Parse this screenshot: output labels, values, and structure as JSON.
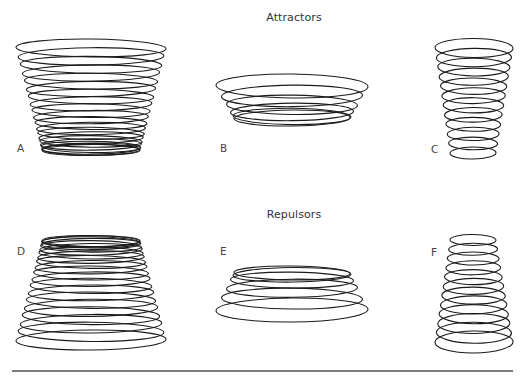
{
  "diagram": {
    "sections": [
      {
        "id": "attractors",
        "title": "Attractors",
        "title_x": 294,
        "title_y": 11
      },
      {
        "id": "repulsors",
        "title": "Repulsors",
        "title_x": 294,
        "title_y": 208
      }
    ],
    "stroke_color": "#1a1a1a",
    "rule_color": "#7d7d7d",
    "panels": [
      {
        "label": "A",
        "section": "attractors",
        "label_x": 17,
        "label_y": 142,
        "rings": 20,
        "top": {
          "cx": 91,
          "cy": 48,
          "rx": 75,
          "ry": 9
        },
        "bottom": {
          "cx": 91,
          "cy": 150,
          "rx": 49,
          "ry": 5.5
        },
        "spacing": "converging"
      },
      {
        "label": "B",
        "section": "attractors",
        "label_x": 220,
        "label_y": 142,
        "rings": 6,
        "top": {
          "cx": 292,
          "cy": 86,
          "rx": 76,
          "ry": 12
        },
        "bottom": {
          "cx": 292,
          "cy": 118,
          "rx": 58,
          "ry": 8
        },
        "spacing": "converging"
      },
      {
        "label": "C",
        "section": "attractors",
        "label_x": 431,
        "label_y": 143,
        "rings": 12,
        "top": {
          "cx": 474,
          "cy": 48,
          "rx": 39,
          "ry": 9.5
        },
        "bottom": {
          "cx": 473,
          "cy": 153,
          "rx": 23,
          "ry": 6
        },
        "spacing": "uniform"
      },
      {
        "label": "D",
        "section": "repulsors",
        "label_x": 17,
        "label_y": 245,
        "rings": 20,
        "top": {
          "cx": 91,
          "cy": 241,
          "rx": 49,
          "ry": 5.5
        },
        "bottom": {
          "cx": 91,
          "cy": 340,
          "rx": 75,
          "ry": 10
        },
        "spacing": "diverging"
      },
      {
        "label": "E",
        "section": "repulsors",
        "label_x": 220,
        "label_y": 245,
        "rings": 6,
        "top": {
          "cx": 292,
          "cy": 273,
          "rx": 58,
          "ry": 7
        },
        "bottom": {
          "cx": 292,
          "cy": 310,
          "rx": 76,
          "ry": 12
        },
        "spacing": "diverging"
      },
      {
        "label": "F",
        "section": "repulsors",
        "label_x": 431,
        "label_y": 246,
        "rings": 12,
        "top": {
          "cx": 473,
          "cy": 240,
          "rx": 23,
          "ry": 5.5
        },
        "bottom": {
          "cx": 474,
          "cy": 342,
          "rx": 39,
          "ry": 11
        },
        "spacing": "uniform"
      }
    ],
    "rule": {
      "x": 12,
      "y": 370,
      "width": 501
    }
  }
}
